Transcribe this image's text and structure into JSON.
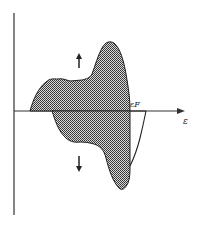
{
  "diagram": {
    "axis_x_label": "ε",
    "fermi_label": "εF",
    "upper_arrow": "↑",
    "lower_arrow": "↓",
    "colors": {
      "ink": "#222222",
      "fill": "#555555"
    }
  }
}
